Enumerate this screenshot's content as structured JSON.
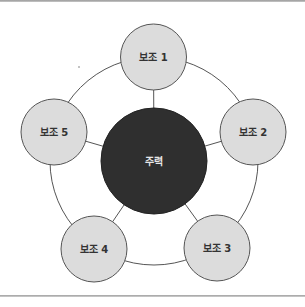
{
  "diagram": {
    "type": "hub-and-spoke",
    "colors": {
      "ring_stroke": "#555555",
      "connector_stroke": "#555555",
      "satellite_fill": "#dcdcdc",
      "satellite_stroke": "#555555",
      "satellite_text": "#333333",
      "hub_fill": "#2f2f2f",
      "hub_stroke": "#222222",
      "hub_text": "#e6e6e6"
    },
    "ring": {
      "cx": 154,
      "cy": 161,
      "r": 104
    },
    "hub": {
      "label": "주력",
      "cx": 154,
      "cy": 161,
      "r": 53
    },
    "satellites": [
      {
        "label": "보조 1",
        "cx": 153.5,
        "cy": 57,
        "r": 33
      },
      {
        "label": "보조 2",
        "cx": 253,
        "cy": 132,
        "r": 33
      },
      {
        "label": "보조 3",
        "cx": 217,
        "cy": 248,
        "r": 33
      },
      {
        "label": "보조 4",
        "cx": 94,
        "cy": 249,
        "r": 33
      },
      {
        "label": "보조 5",
        "cx": 54,
        "cy": 132,
        "r": 33
      }
    ]
  }
}
